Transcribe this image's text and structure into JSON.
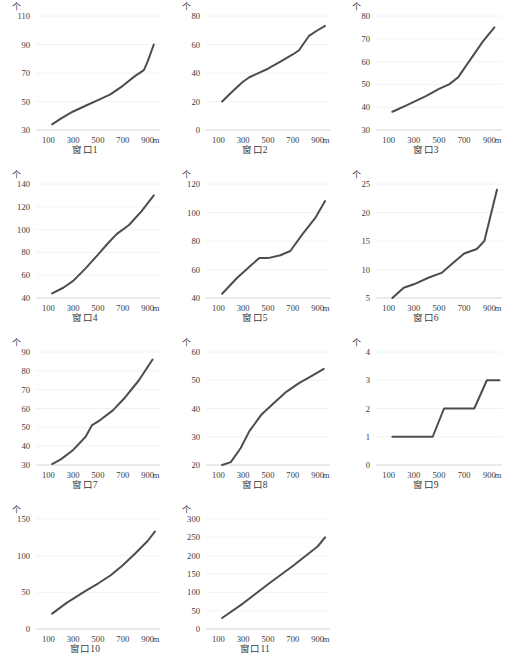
{
  "figure": {
    "unit_label": "个",
    "x_unit_label": "m",
    "panel_count": 11,
    "line_color": "#4d4d4d",
    "grid_color": "#efefef",
    "text_color": "#3a3a3a"
  },
  "chart_data": [
    {
      "type": "line",
      "title": "窗口1",
      "xlabel": "m",
      "ylabel": "个",
      "grid": true,
      "legend": "none",
      "xlim": [
        0,
        1000
      ],
      "ylim": [
        30,
        110
      ],
      "xticks": [
        100,
        300,
        500,
        700,
        900
      ],
      "yticks": [
        30,
        50,
        70,
        90,
        110
      ],
      "x": [
        130,
        200,
        300,
        400,
        500,
        600,
        700,
        800,
        870,
        900,
        950
      ],
      "values": [
        34,
        38,
        43,
        47,
        51,
        55,
        61,
        68,
        72,
        78,
        90
      ]
    },
    {
      "type": "line",
      "title": "窗口2",
      "xlabel": "m",
      "ylabel": "个",
      "grid": true,
      "legend": "none",
      "xlim": [
        0,
        1000
      ],
      "ylim": [
        0,
        80
      ],
      "xticks": [
        100,
        300,
        500,
        700,
        900
      ],
      "yticks": [
        0,
        20,
        40,
        60,
        80
      ],
      "x": [
        130,
        200,
        300,
        350,
        400,
        500,
        600,
        700,
        750,
        830,
        900,
        960
      ],
      "values": [
        20,
        26,
        34,
        37,
        39,
        43,
        48,
        53,
        56,
        66,
        70,
        73
      ]
    },
    {
      "type": "line",
      "title": "窗口3",
      "xlabel": "m",
      "ylabel": "个",
      "grid": true,
      "legend": "none",
      "xlim": [
        0,
        1000
      ],
      "ylim": [
        30,
        80
      ],
      "xticks": [
        100,
        300,
        500,
        700,
        900
      ],
      "yticks": [
        30,
        40,
        50,
        60,
        70,
        80
      ],
      "x": [
        130,
        250,
        400,
        500,
        580,
        650,
        750,
        850,
        940
      ],
      "values": [
        38,
        41,
        45,
        48,
        50,
        53,
        61,
        69,
        75
      ]
    },
    {
      "type": "line",
      "title": "窗口4",
      "xlabel": "m",
      "ylabel": "个",
      "grid": true,
      "legend": "none",
      "xlim": [
        0,
        1000
      ],
      "ylim": [
        40,
        140
      ],
      "xticks": [
        100,
        300,
        500,
        700,
        900
      ],
      "yticks": [
        40,
        60,
        80,
        100,
        120,
        140
      ],
      "x": [
        130,
        220,
        300,
        400,
        500,
        580,
        650,
        750,
        850,
        950
      ],
      "values": [
        44,
        49,
        55,
        66,
        78,
        88,
        96,
        104,
        116,
        130
      ]
    },
    {
      "type": "line",
      "title": "窗口5",
      "xlabel": "m",
      "ylabel": "个",
      "grid": true,
      "legend": "none",
      "xlim": [
        0,
        1000
      ],
      "ylim": [
        40,
        120
      ],
      "xticks": [
        100,
        300,
        500,
        700,
        900
      ],
      "yticks": [
        40,
        60,
        80,
        100,
        120
      ],
      "x": [
        130,
        250,
        350,
        430,
        500,
        600,
        680,
        780,
        880,
        960
      ],
      "values": [
        43,
        54,
        62,
        68,
        68,
        70,
        73,
        85,
        96,
        108
      ]
    },
    {
      "type": "line",
      "title": "窗口6",
      "xlabel": "m",
      "ylabel": "个",
      "grid": true,
      "legend": "none",
      "xlim": [
        0,
        1000
      ],
      "ylim": [
        5,
        25
      ],
      "xticks": [
        100,
        300,
        500,
        700,
        900
      ],
      "yticks": [
        5,
        10,
        15,
        20,
        25
      ],
      "x": [
        130,
        220,
        300,
        420,
        520,
        620,
        700,
        800,
        860,
        960
      ],
      "values": [
        5,
        6.8,
        7.4,
        8.6,
        9.4,
        11.3,
        12.8,
        13.6,
        15,
        24
      ]
    },
    {
      "type": "line",
      "title": "窗口7",
      "xlabel": "m",
      "ylabel": "个",
      "grid": true,
      "legend": "none",
      "xlim": [
        0,
        1000
      ],
      "ylim": [
        30,
        90
      ],
      "xticks": [
        100,
        300,
        500,
        700,
        900
      ],
      "yticks": [
        30,
        40,
        50,
        60,
        70,
        80,
        90
      ],
      "x": [
        130,
        200,
        300,
        400,
        450,
        520,
        620,
        720,
        830,
        940
      ],
      "values": [
        30.5,
        33,
        38,
        45,
        51,
        54,
        59,
        66,
        75,
        86
      ]
    },
    {
      "type": "line",
      "title": "窗口8",
      "xlabel": "m",
      "ylabel": "个",
      "grid": true,
      "legend": "none",
      "xlim": [
        0,
        1000
      ],
      "ylim": [
        20,
        60
      ],
      "xticks": [
        100,
        300,
        500,
        700,
        900
      ],
      "yticks": [
        20,
        30,
        40,
        50,
        60
      ],
      "x": [
        130,
        200,
        280,
        350,
        450,
        550,
        650,
        750,
        850,
        950
      ],
      "values": [
        20,
        21,
        26,
        32,
        38,
        42,
        46,
        49,
        51.5,
        54
      ]
    },
    {
      "type": "line",
      "title": "窗口9",
      "xlabel": "m",
      "ylabel": "个",
      "grid": true,
      "legend": "none",
      "xlim": [
        0,
        1000
      ],
      "ylim": [
        0,
        4
      ],
      "xticks": [
        100,
        300,
        500,
        700,
        900
      ],
      "yticks": [
        0,
        1,
        2,
        3,
        4
      ],
      "x": [
        130,
        450,
        540,
        780,
        880,
        980
      ],
      "values": [
        1,
        1,
        2,
        2,
        3,
        3
      ]
    },
    {
      "type": "line",
      "title": "窗口10",
      "xlabel": "m",
      "ylabel": "个",
      "grid": true,
      "legend": "none",
      "xlim": [
        0,
        1000
      ],
      "ylim": [
        0,
        150
      ],
      "xticks": [
        100,
        300,
        500,
        700,
        900
      ],
      "yticks": [
        0,
        50,
        100,
        150
      ],
      "x": [
        130,
        250,
        400,
        500,
        600,
        700,
        800,
        900,
        960
      ],
      "values": [
        21,
        36,
        52,
        62,
        73,
        87,
        103,
        120,
        133
      ]
    },
    {
      "type": "line",
      "title": "窗口11",
      "xlabel": "m",
      "ylabel": "个",
      "grid": true,
      "legend": "none",
      "xlim": [
        0,
        1000
      ],
      "ylim": [
        0,
        300
      ],
      "xticks": [
        100,
        300,
        500,
        700,
        900
      ],
      "yticks": [
        0,
        50,
        100,
        150,
        200,
        250,
        300
      ],
      "x": [
        130,
        300,
        500,
        700,
        900,
        960
      ],
      "values": [
        30,
        70,
        122,
        172,
        225,
        250
      ]
    }
  ]
}
